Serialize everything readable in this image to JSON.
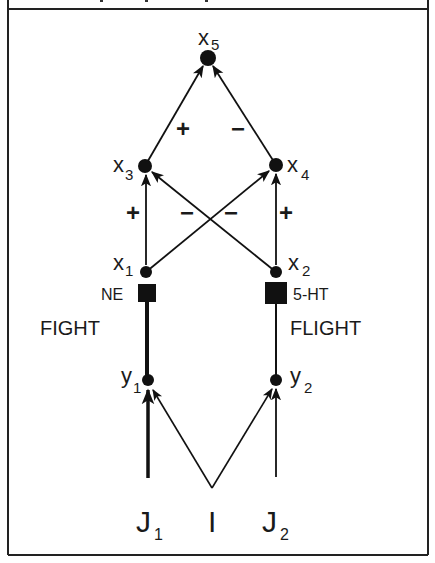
{
  "diagram": {
    "nodes": {
      "x5": {
        "label": "x",
        "sub": "5"
      },
      "x3": {
        "label": "x",
        "sub": "3"
      },
      "x4": {
        "label": "x",
        "sub": "4"
      },
      "x1": {
        "label": "x",
        "sub": "1"
      },
      "x2": {
        "label": "x",
        "sub": "2"
      },
      "y1": {
        "label": "y",
        "sub": "1"
      },
      "y2": {
        "label": "y",
        "sub": "2"
      }
    },
    "transmitters": {
      "left": "NE",
      "right": "5-HT"
    },
    "pathways": {
      "left": "FIGHT",
      "right": "FLIGHT"
    },
    "inputs": {
      "j1": {
        "label": "J",
        "sub": "1"
      },
      "i": {
        "label": "I"
      },
      "j2": {
        "label": "J",
        "sub": "2"
      }
    },
    "signs": {
      "x3_to_x5": "+",
      "x4_to_x5": "−",
      "x1_to_x3": "+",
      "x2_to_x3": "−",
      "x1_to_x4": "−",
      "x2_to_x4": "+"
    },
    "edges": [
      {
        "from": "x3",
        "to": "x5",
        "sign": "+"
      },
      {
        "from": "x4",
        "to": "x5",
        "sign": "-"
      },
      {
        "from": "x1",
        "to": "x3",
        "sign": "+"
      },
      {
        "from": "x2",
        "to": "x3",
        "sign": "-"
      },
      {
        "from": "x1",
        "to": "x4",
        "sign": "-"
      },
      {
        "from": "x2",
        "to": "x4",
        "sign": "+"
      },
      {
        "from": "y1",
        "to": "x1",
        "via": "NE",
        "weight": "thick"
      },
      {
        "from": "y2",
        "to": "x2",
        "via": "5-HT",
        "weight": "thin"
      },
      {
        "from": "J1",
        "to": "y1",
        "weight": "thick"
      },
      {
        "from": "I",
        "to": "y1"
      },
      {
        "from": "I",
        "to": "y2"
      },
      {
        "from": "J2",
        "to": "y2"
      }
    ]
  }
}
